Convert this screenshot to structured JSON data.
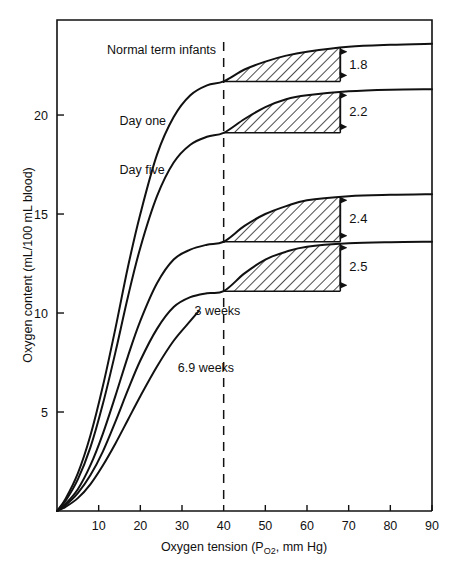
{
  "chart_data": {
    "type": "line",
    "title": "",
    "xlabel": "Oxygen tension (PO₂, mm Hg)",
    "xlabel_main": "Oxygen tension (P",
    "xlabel_sub": "O2",
    "xlabel_tail": ", mm Hg)",
    "ylabel": "Oxygen content (mL/100 mL blood)",
    "xlim": [
      0,
      90
    ],
    "ylim": [
      0,
      24.8
    ],
    "grid": false,
    "legend": "inline-curve-labels",
    "xticks": [
      10,
      20,
      30,
      40,
      50,
      60,
      70,
      80,
      90
    ],
    "xtick_labels": [
      "10",
      "20",
      "30",
      "40",
      "50",
      "60",
      "70",
      "80",
      "90"
    ],
    "yticks": [
      5,
      10,
      15,
      20
    ],
    "ytick_labels": [
      "5",
      "10",
      "15",
      "20"
    ],
    "reference_line": {
      "x": 40,
      "style": "dashed",
      "label": ""
    },
    "series": [
      {
        "name": "Normal term infants",
        "label": "Normal term infants",
        "label_x": 12,
        "label_y": 23.1,
        "plateau": 23.6,
        "value_at_40": 21.7,
        "points": [
          [
            0,
            0
          ],
          [
            2,
            0.6
          ],
          [
            5,
            1.9
          ],
          [
            8,
            3.8
          ],
          [
            11,
            6.3
          ],
          [
            14,
            9.2
          ],
          [
            17,
            12.3
          ],
          [
            20,
            15.0
          ],
          [
            24,
            18.0
          ],
          [
            28,
            19.9
          ],
          [
            32,
            21.0
          ],
          [
            36,
            21.5
          ],
          [
            40,
            21.7
          ],
          [
            45,
            22.3
          ],
          [
            50,
            22.7
          ],
          [
            55,
            23.0
          ],
          [
            60,
            23.2
          ],
          [
            70,
            23.45
          ],
          [
            80,
            23.55
          ],
          [
            90,
            23.6
          ]
        ]
      },
      {
        "name": "Day one",
        "label": "Day one",
        "label_x": 15,
        "label_y": 19.5,
        "plateau": 21.3,
        "value_at_40": 19.1,
        "points": [
          [
            0,
            0
          ],
          [
            2,
            0.5
          ],
          [
            5,
            1.6
          ],
          [
            8,
            3.2
          ],
          [
            11,
            5.4
          ],
          [
            14,
            8.0
          ],
          [
            17,
            10.8
          ],
          [
            20,
            13.3
          ],
          [
            24,
            15.9
          ],
          [
            28,
            17.6
          ],
          [
            32,
            18.5
          ],
          [
            36,
            18.9
          ],
          [
            40,
            19.1
          ],
          [
            45,
            19.8
          ],
          [
            50,
            20.4
          ],
          [
            55,
            20.8
          ],
          [
            60,
            21.0
          ],
          [
            70,
            21.2
          ],
          [
            80,
            21.28
          ],
          [
            90,
            21.3
          ]
        ]
      },
      {
        "name": "Day five",
        "label": "Day five",
        "label_x": 15,
        "label_y": 17.0,
        "plateau": 16.0,
        "value_at_40": 13.6,
        "points": [
          [
            0,
            0
          ],
          [
            2,
            0.35
          ],
          [
            5,
            1.1
          ],
          [
            8,
            2.3
          ],
          [
            11,
            3.9
          ],
          [
            14,
            5.8
          ],
          [
            17,
            7.8
          ],
          [
            20,
            9.6
          ],
          [
            24,
            11.5
          ],
          [
            28,
            12.7
          ],
          [
            32,
            13.2
          ],
          [
            36,
            13.45
          ],
          [
            40,
            13.6
          ],
          [
            45,
            14.4
          ],
          [
            50,
            15.0
          ],
          [
            55,
            15.4
          ],
          [
            60,
            15.7
          ],
          [
            70,
            15.9
          ],
          [
            80,
            15.97
          ],
          [
            90,
            16.0
          ]
        ]
      },
      {
        "name": "3 weeks",
        "label": "3 weeks",
        "label_x": 33,
        "label_y": 9.9,
        "plateau": 13.6,
        "value_at_40": 11.1,
        "points": [
          [
            0,
            0
          ],
          [
            2,
            0.28
          ],
          [
            5,
            0.9
          ],
          [
            8,
            1.8
          ],
          [
            11,
            3.0
          ],
          [
            14,
            4.5
          ],
          [
            17,
            6.1
          ],
          [
            20,
            7.6
          ],
          [
            24,
            9.2
          ],
          [
            28,
            10.3
          ],
          [
            32,
            10.8
          ],
          [
            36,
            11.0
          ],
          [
            40,
            11.1
          ],
          [
            45,
            12.0
          ],
          [
            50,
            12.7
          ],
          [
            55,
            13.1
          ],
          [
            60,
            13.35
          ],
          [
            70,
            13.52
          ],
          [
            80,
            13.58
          ],
          [
            90,
            13.6
          ]
        ]
      },
      {
        "name": "6.9 weeks",
        "label": "6.9 weeks",
        "label_x": 29,
        "label_y": 7.0,
        "plateau": null,
        "value_at_40": null,
        "points": [
          [
            0,
            0
          ],
          [
            2,
            0.2
          ],
          [
            5,
            0.65
          ],
          [
            8,
            1.35
          ],
          [
            11,
            2.3
          ],
          [
            14,
            3.4
          ],
          [
            17,
            4.6
          ],
          [
            20,
            5.8
          ],
          [
            24,
            7.3
          ],
          [
            28,
            8.6
          ],
          [
            32,
            9.6
          ],
          [
            34,
            10.1
          ]
        ]
      }
    ],
    "annotations": [
      {
        "name": "gap-1",
        "label": "1.8",
        "value": 1.8,
        "from_series": "Day one",
        "to_series": "Normal term infants",
        "x_start": 40,
        "x_end": 68,
        "y_base": 21.7,
        "y_top": 23.5
      },
      {
        "name": "gap-2",
        "label": "2.2",
        "value": 2.2,
        "from_series": "Day five",
        "to_series": "Day one",
        "x_start": 40,
        "x_end": 68,
        "y_base": 19.1,
        "y_top": 21.3
      },
      {
        "name": "gap-3",
        "label": "2.4",
        "value": 2.4,
        "from_series": "3 weeks",
        "to_series": "Day five",
        "x_start": 40,
        "x_end": 68,
        "y_base": 13.6,
        "y_top": 16.0
      },
      {
        "name": "gap-4",
        "label": "2.5",
        "value": 2.5,
        "from_series": "6.9 weeks",
        "to_series": "3 weeks",
        "x_start": 40,
        "x_end": 68,
        "y_base": 11.1,
        "y_top": 13.6
      }
    ]
  },
  "colors": {
    "ink": "#111111",
    "background": "#ffffff"
  }
}
